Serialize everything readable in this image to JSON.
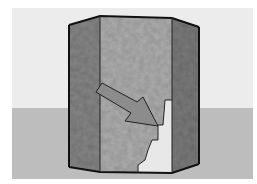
{
  "scene": {
    "description": "3D octagonal prism with stone texture, cut-away notch and arrow",
    "colors": {
      "border": "#ffffff",
      "sky": "#ececec",
      "ground": "#bdbdbd",
      "left_face": "#8a8a8a",
      "front_face": "#b0b0b0",
      "right_face": "#7e7e7e",
      "notch": "#e6e6e6",
      "arrow": "#8c8c8c",
      "outline": "#1a1a1a"
    }
  }
}
